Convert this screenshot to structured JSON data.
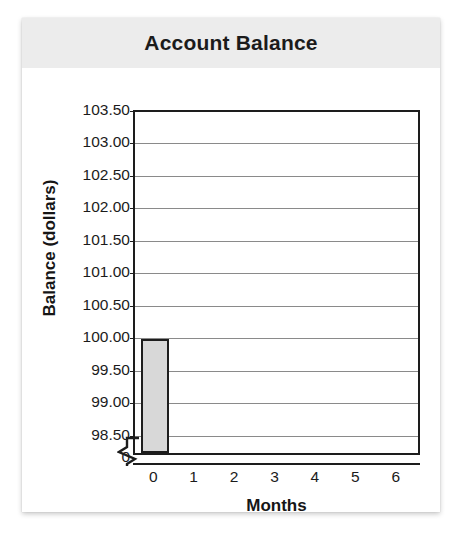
{
  "chart_data": {
    "type": "bar",
    "title": "Account Balance",
    "xlabel": "Months",
    "ylabel": "Balance (dollars)",
    "categories": [
      "0",
      "1",
      "2",
      "3",
      "4",
      "5",
      "6"
    ],
    "values": [
      100.0,
      null,
      null,
      null,
      null,
      null,
      null
    ],
    "ylim": [
      98.25,
      103.5
    ],
    "y_ticks": [
      "103.50",
      "103.00",
      "102.50",
      "102.00",
      "101.50",
      "101.00",
      "100.50",
      "100.00",
      "99.50",
      "99.00",
      "98.50"
    ],
    "y_tick_values": [
      103.5,
      103.0,
      102.5,
      102.0,
      101.5,
      101.0,
      100.5,
      100.0,
      99.5,
      99.0,
      98.5
    ],
    "y_axis_break_label": "0",
    "y_axis_break": true,
    "grid": true,
    "legend": false,
    "bar_fill_color": "#d8d8d8",
    "bar_border_color": "#1d1d1d",
    "gridline_color": "#8a8a8a",
    "axis_color": "#1d1d1d",
    "title_band_color": "#ececec",
    "background_color": "#ffffff"
  }
}
